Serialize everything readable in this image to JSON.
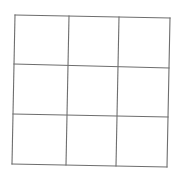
{
  "diagram": {
    "type": "grid",
    "rows": 3,
    "columns": 3,
    "line_color": "#6e6e6e",
    "background": "#ffffff",
    "corners": {
      "top_left": [
        15,
        15
      ],
      "top_right": [
        170,
        18
      ],
      "bottom_left": [
        12,
        164
      ],
      "bottom_right": [
        167,
        167
      ]
    },
    "cells": [
      {
        "row": 0,
        "col": 0,
        "content": ""
      },
      {
        "row": 0,
        "col": 1,
        "content": ""
      },
      {
        "row": 0,
        "col": 2,
        "content": ""
      },
      {
        "row": 1,
        "col": 0,
        "content": ""
      },
      {
        "row": 1,
        "col": 1,
        "content": ""
      },
      {
        "row": 1,
        "col": 2,
        "content": ""
      },
      {
        "row": 2,
        "col": 0,
        "content": ""
      },
      {
        "row": 2,
        "col": 1,
        "content": ""
      },
      {
        "row": 2,
        "col": 2,
        "content": ""
      }
    ]
  }
}
